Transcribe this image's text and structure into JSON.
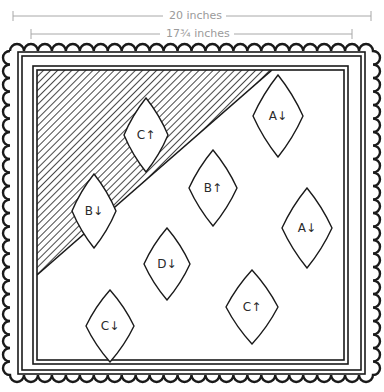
{
  "dimensions": {
    "outer": {
      "label": "20 inches"
    },
    "inner": {
      "label": "17¾ inches"
    }
  },
  "colors": {
    "ink": "#1a1a1a",
    "dimension_line": "#a8a8a8",
    "background": "#ffffff"
  },
  "diagram": {
    "hatched_region": "top-left triangle",
    "pieces": [
      {
        "id": "c-up-top",
        "label": "C↑",
        "cx": 146,
        "cy": 135,
        "w": 44,
        "h": 74
      },
      {
        "id": "a-down-top",
        "label": "A↓",
        "cx": 278,
        "cy": 116,
        "w": 50,
        "h": 82
      },
      {
        "id": "b-down",
        "label": "B↓",
        "cx": 94,
        "cy": 211,
        "w": 44,
        "h": 74
      },
      {
        "id": "b-up",
        "label": "B↑",
        "cx": 213,
        "cy": 188,
        "w": 48,
        "h": 76
      },
      {
        "id": "a-down-right",
        "label": "A↓",
        "cx": 307,
        "cy": 228,
        "w": 50,
        "h": 80
      },
      {
        "id": "d-down",
        "label": "D↓",
        "cx": 167,
        "cy": 264,
        "w": 46,
        "h": 72
      },
      {
        "id": "c-up-bottom",
        "label": "C↑",
        "cx": 252,
        "cy": 307,
        "w": 52,
        "h": 74
      },
      {
        "id": "c-down",
        "label": "C↓",
        "cx": 110,
        "cy": 326,
        "w": 48,
        "h": 72
      }
    ]
  }
}
